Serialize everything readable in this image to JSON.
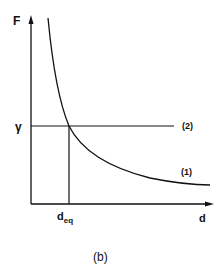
{
  "diagram": {
    "caption": "(b)",
    "y_axis_label": "F",
    "x_axis_label": "d",
    "y_marker_label": "γ",
    "x_marker_label_main": "d",
    "x_marker_label_sub": "eq",
    "curve_labels": [
      "(1)",
      "(2)"
    ],
    "curves": [
      {
        "id": "1",
        "description": "decreasing hyperbolic curve F(d)"
      },
      {
        "id": "2",
        "description": "horizontal line F = γ"
      }
    ],
    "intersection": "d_eq"
  }
}
